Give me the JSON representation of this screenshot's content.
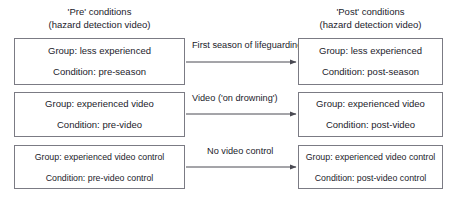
{
  "headers": {
    "pre": "'Pre' conditions\n(hazard detection video)",
    "pre_line1": "'Pre' conditions",
    "pre_line2": "(hazard detection video)",
    "post_line1": "'Post' conditions",
    "post_line2": "(hazard detection video)"
  },
  "pre_boxes": [
    {
      "group": "Group: less experienced",
      "condition": "Condition: pre-season"
    },
    {
      "group": "Group: experienced video",
      "condition": "Condition: pre-video"
    },
    {
      "group": "Group: experienced video control",
      "condition": "Condition: pre-video control"
    }
  ],
  "post_boxes": [
    {
      "group": "Group: less experienced",
      "condition": "Condition: post-season"
    },
    {
      "group": "Group: experienced video",
      "condition": "Condition: post-video"
    },
    {
      "group": "Group: experienced video control",
      "condition": "Condition: post-video control"
    }
  ],
  "edges": [
    {
      "label": "First season of lifeguarding"
    },
    {
      "label": "Video ('on drowning')"
    },
    {
      "label": "No video control"
    }
  ],
  "colors": {
    "box_border": "#7b7b84",
    "text": "#1b1b2b",
    "arrow": "#4a4a53",
    "background": "#ffffff"
  }
}
